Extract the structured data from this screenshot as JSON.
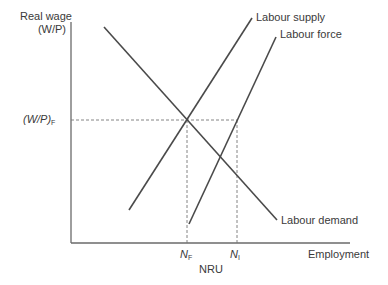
{
  "diagram": {
    "y_axis_label_line1": "Real wage",
    "y_axis_label_line2": "(W/P)",
    "x_axis_label": "Employment",
    "equilibrium_wage_label": "(W/P)",
    "equilibrium_wage_sub": "F",
    "nf_label": "N",
    "nf_sub": "F",
    "ni_label": "N",
    "ni_sub": "I",
    "nru_label": "NRU",
    "curves": {
      "labour_supply": "Labour supply",
      "labour_force": "Labour force",
      "labour_demand": "Labour demand"
    },
    "colors": {
      "line": "#4a4a4a",
      "axis": "#6a6a6a",
      "dashed": "#777777"
    }
  }
}
